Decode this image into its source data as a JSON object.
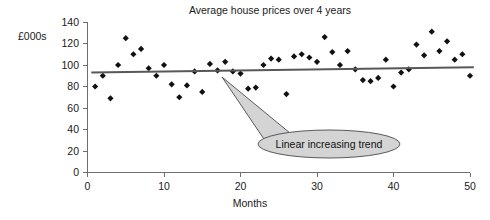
{
  "chart_data": {
    "type": "scatter",
    "title": "Average house prices over 4 years",
    "xlabel": "Months",
    "ylabel": "£000s",
    "xlim": [
      0,
      50
    ],
    "ylim": [
      0,
      140
    ],
    "xticks": [
      0,
      10,
      20,
      30,
      40,
      50
    ],
    "yticks": [
      0,
      20,
      40,
      60,
      80,
      100,
      120,
      140
    ],
    "xtick_labels": [
      "0",
      "10",
      "20",
      "30",
      "40",
      "50"
    ],
    "ytick_labels": [
      "0",
      "20",
      "40",
      "60",
      "80",
      "100",
      "120",
      "140"
    ],
    "grid": false,
    "legend": "none",
    "series": [
      {
        "name": "Average house price",
        "marker": "diamond",
        "color": "#111111",
        "x": [
          1,
          2,
          3,
          4,
          5,
          6,
          7,
          8,
          9,
          10,
          11,
          12,
          13,
          14,
          15,
          16,
          17,
          18,
          19,
          20,
          21,
          22,
          23,
          24,
          25,
          26,
          27,
          28,
          29,
          30,
          31,
          32,
          33,
          34,
          35,
          36,
          37,
          38,
          39,
          40,
          41,
          42,
          43,
          44,
          45,
          46,
          47,
          48,
          49,
          50
        ],
        "y": [
          80,
          90,
          69,
          100,
          125,
          110,
          115,
          97,
          90,
          100,
          82,
          70,
          81,
          94,
          75,
          101,
          95,
          103,
          94,
          92,
          78,
          79,
          100,
          106,
          105,
          73,
          108,
          110,
          107,
          103,
          126,
          112,
          100,
          113,
          96,
          86,
          85,
          88,
          105,
          80,
          93,
          96,
          119,
          109,
          131,
          113,
          122,
          105,
          110,
          90
        ]
      }
    ],
    "trend_line": {
      "label": "Linear increasing trend",
      "x_start": 0.5,
      "x_end": 50.5,
      "y_start": 93,
      "y_end": 98,
      "color": "#58585a"
    },
    "annotation": {
      "text": "Linear increasing trend",
      "pointer_x": 22,
      "pointer_y": 95
    }
  }
}
